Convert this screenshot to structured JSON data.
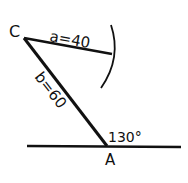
{
  "diagram": {
    "labels": {
      "point_c": "C",
      "point_a": "A",
      "side_a": "a=40",
      "side_b": "b=60",
      "angle": "130°"
    },
    "colors": {
      "stroke": "#111111",
      "background": "#ffffff"
    }
  }
}
